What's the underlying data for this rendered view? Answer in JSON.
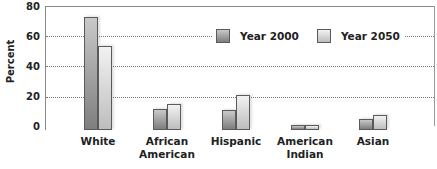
{
  "chart_data": {
    "type": "bar",
    "title": "",
    "xlabel": "",
    "ylabel": "Percent",
    "ylim": [
      0,
      80
    ],
    "yticks": [
      0,
      20,
      40,
      60,
      80
    ],
    "grid": true,
    "legend_position": "upper right (inside plot, over 60 gridline)",
    "categories": [
      "White",
      "African American",
      "Hispanic",
      "American Indian",
      "Asian"
    ],
    "category_lines": [
      [
        "White"
      ],
      [
        "African",
        "American"
      ],
      [
        "Hispanic"
      ],
      [
        "American",
        "Indian"
      ],
      [
        "Asian"
      ]
    ],
    "series": [
      {
        "name": "Year 2000",
        "color": "#9a9a9a",
        "values": [
          72,
          12,
          11,
          1,
          5
        ]
      },
      {
        "name": "Year 2050",
        "color": "#dcdcdc",
        "values": [
          53,
          15,
          21,
          1,
          8
        ]
      }
    ]
  },
  "axis": {
    "ylabel": "Percent",
    "yticks": [
      "80",
      "60",
      "40",
      "20",
      "0"
    ]
  },
  "legend": {
    "items": [
      {
        "label": "Year 2000"
      },
      {
        "label": "Year 2050"
      }
    ]
  },
  "categories": [
    {
      "line1": "White",
      "line2": ""
    },
    {
      "line1": "African",
      "line2": "American"
    },
    {
      "line1": "Hispanic",
      "line2": ""
    },
    {
      "line1": "American",
      "line2": "Indian"
    },
    {
      "line1": "Asian",
      "line2": ""
    }
  ]
}
